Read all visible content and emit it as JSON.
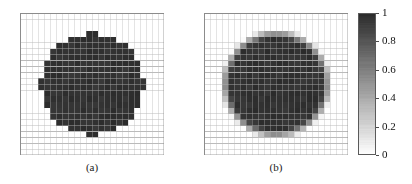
{
  "figure": {
    "background_color": "#ffffff",
    "width": 412,
    "height": 184
  },
  "panels": [
    {
      "id": "panel-a",
      "caption": "(a)",
      "x": 20,
      "y": 13,
      "width": 144,
      "height": 142,
      "grid": {
        "cols": 24,
        "rows": 24,
        "line_color": "#b4b4b4",
        "show": true
      },
      "edge_style": "hard",
      "description": "binary pixelated disk, sharp staircase boundary"
    },
    {
      "id": "panel-b",
      "caption": "(b)",
      "x": 204,
      "y": 13,
      "width": 144,
      "height": 142,
      "grid": {
        "cols": 24,
        "rows": 24,
        "line_color": "#b4b4b4",
        "show": true
      },
      "edge_style": "smooth",
      "description": "disk with anti-aliased grey halo at boundary"
    }
  ],
  "colorbar": {
    "x": 358,
    "y": 13,
    "width": 18,
    "height": 142,
    "orientation": "vertical",
    "vmin": 0,
    "vmax": 1,
    "colormap": "grayscale-inverted",
    "color_high": "#2b2b2b",
    "color_low": "#ffffff",
    "tick_values": [
      1,
      0.8,
      0.6,
      0.4,
      0.2,
      0
    ],
    "tick_labels": [
      "1",
      "0.8",
      "0.6",
      "0.4",
      "0.2",
      "0"
    ]
  },
  "chart_data": {
    "type": "heatmap",
    "title": "",
    "xlabel": "",
    "ylabel": "",
    "n_panels": 2,
    "grid_cols": 24,
    "grid_rows": 24,
    "value_range": [
      0,
      1
    ],
    "colorbar_ticks": [
      1,
      0.8,
      0.6,
      0.4,
      0.2,
      0
    ],
    "colorbar_tick_labels": [
      "1",
      "0.8",
      "0.6",
      "0.4",
      "0.2",
      "0"
    ],
    "panel_captions": [
      "(a)",
      "(b)"
    ],
    "legend_position": "right",
    "grid": true,
    "panels": [
      {
        "label": "(a)",
        "shape": "disk",
        "center": [
          11.5,
          11.5
        ],
        "radius": 8.6,
        "edge": "hard",
        "inside_value": 1.0,
        "outside_value": 0.0,
        "noise_amplitude": 0.06,
        "note": "Binary indicator field on a 24x24 mesh: cells are either fully dark (value ~1) or white (value 0); the circular boundary is rendered as a pixelated staircase."
      },
      {
        "label": "(b)",
        "shape": "disk",
        "center": [
          11.5,
          11.5
        ],
        "radius": 8.6,
        "edge": "smooth",
        "inside_value": 1.0,
        "outside_value": 0.0,
        "transition_width": 1.6,
        "noise_amplitude": 0.06,
        "note": "Same disk represented with a smoothed/regularised interface: a one-to-two cell wide band of intermediate grey values (roughly 0.2-0.8) surrounds the dark core."
      }
    ]
  }
}
